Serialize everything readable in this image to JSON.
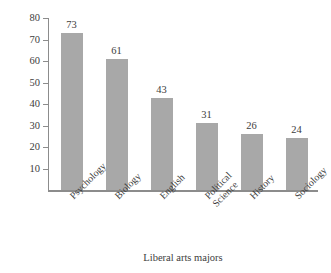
{
  "chart_data": {
    "type": "bar",
    "title": "",
    "xlabel": "Liberal arts majors",
    "ylabel": "Thousands of graduates",
    "categories": [
      "Psychology",
      "Biology",
      "English",
      "Political Science",
      "History",
      "Sociology"
    ],
    "values": [
      73,
      61,
      43,
      31,
      26,
      24
    ],
    "ylim": [
      0,
      80
    ],
    "yticks": [
      10,
      20,
      30,
      40,
      50,
      60,
      70,
      80
    ],
    "ytick_labels": [
      "10",
      "20",
      "30",
      "40",
      "50",
      "60",
      "70",
      "80"
    ],
    "grid": false,
    "legend": false,
    "bar_color": "#a8a8a8",
    "axis_color": "#8c8c8c",
    "background": "#ffffff"
  },
  "axes": {
    "y_title": "Thousands of graduates",
    "x_title": "Liberal arts majors"
  },
  "ticks": [
    {
      "label": "80",
      "value": 80
    },
    {
      "label": "70",
      "value": 70
    },
    {
      "label": "60",
      "value": 60
    },
    {
      "label": "50",
      "value": 50
    },
    {
      "label": "40",
      "value": 40
    },
    {
      "label": "30",
      "value": 30
    },
    {
      "label": "20",
      "value": 20
    },
    {
      "label": "10",
      "value": 10
    }
  ],
  "bars": [
    {
      "category": "Psychology",
      "cat_line1": "Psychology",
      "cat_line2": "",
      "value": 73,
      "value_label": "73"
    },
    {
      "category": "Biology",
      "cat_line1": "Biology",
      "cat_line2": "",
      "value": 61,
      "value_label": "61"
    },
    {
      "category": "English",
      "cat_line1": "English",
      "cat_line2": "",
      "value": 43,
      "value_label": "43"
    },
    {
      "category": "Political Science",
      "cat_line1": "Political",
      "cat_line2": "Science",
      "value": 31,
      "value_label": "31"
    },
    {
      "category": "History",
      "cat_line1": "History",
      "cat_line2": "",
      "value": 26,
      "value_label": "26"
    },
    {
      "category": "Sociology",
      "cat_line1": "Sociology",
      "cat_line2": "",
      "value": 24,
      "value_label": "24"
    }
  ]
}
